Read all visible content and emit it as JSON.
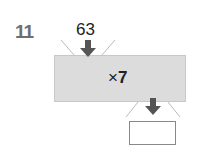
{
  "problem": {
    "number": "11",
    "input_value": "63",
    "operation_symbol": "×",
    "operation_operand": "7",
    "answer": ""
  },
  "icons": {
    "input_arrow": "arrow-down-icon",
    "output_arrow": "arrow-down-icon"
  },
  "colors": {
    "machine_fill": "#dcdcdc",
    "arrow": "#555555",
    "number": "#6e6e6e"
  }
}
